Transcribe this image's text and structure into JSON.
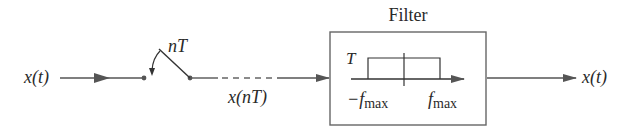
{
  "diagram": {
    "type": "signal-flow block diagram",
    "input": {
      "label": "x(t)"
    },
    "sampler": {
      "label": "nT",
      "kind": "switch"
    },
    "sampled_signal": {
      "label": "x(nT)"
    },
    "filter": {
      "title": "Filter",
      "gain_label": "T",
      "left_freq_label": "−f",
      "left_freq_sub": "max",
      "right_freq_label": "f",
      "right_freq_sub": "max"
    },
    "output": {
      "label": "x(t)"
    },
    "colors": {
      "line": "#555555",
      "text": "#2a2a2a",
      "box": "#666666"
    }
  }
}
